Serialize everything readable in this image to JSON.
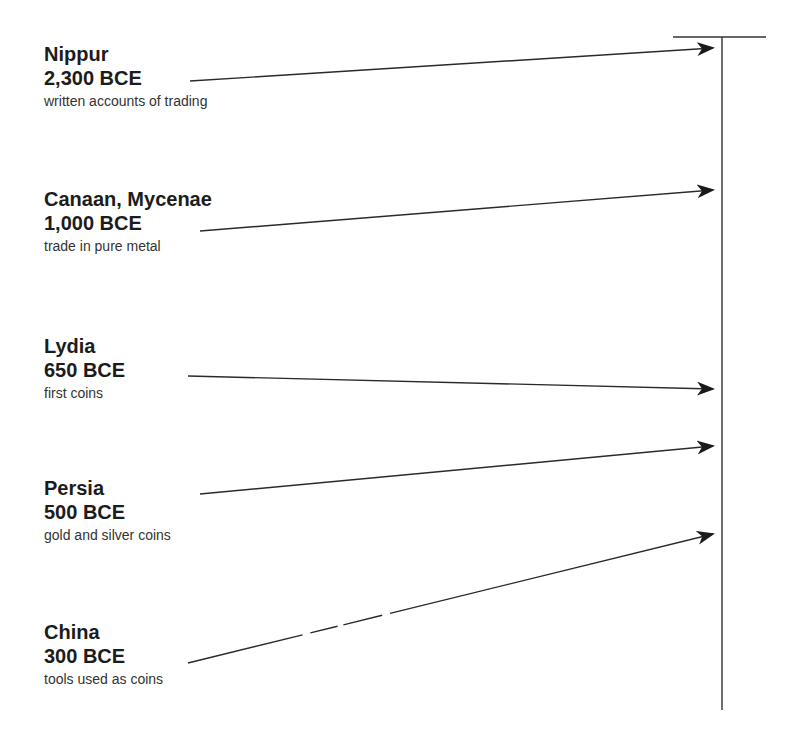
{
  "diagram": {
    "type": "timeline",
    "axis": {
      "orientation": "vertical",
      "x": 722,
      "top": 37,
      "bottom": 710
    },
    "entries": [
      {
        "place": "Nippur",
        "date": "2,300 BCE",
        "desc": "written accounts of trading"
      },
      {
        "place": "Canaan, Mycenae",
        "date": "1,000 BCE",
        "desc": "trade in pure metal"
      },
      {
        "place": "Lydia",
        "date": "650 BCE",
        "desc": "first coins"
      },
      {
        "place": "Persia",
        "date": "500 BCE",
        "desc": "gold and silver coins"
      },
      {
        "place": "China",
        "date": "300 BCE",
        "desc": "tools used as coins"
      }
    ]
  },
  "colors": {
    "line": "#2a2a2a",
    "text": "#1c1c1c",
    "background": "#ffffff"
  }
}
